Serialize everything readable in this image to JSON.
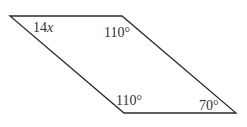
{
  "diagram": {
    "type": "parallelogram",
    "stroke_color": "#2b2b2b",
    "vertices": {
      "top_left": [
        10,
        16
      ],
      "top_right": [
        122,
        16
      ],
      "bottom_right": [
        236,
        113
      ],
      "bottom_left": [
        124,
        113
      ]
    },
    "angles": {
      "top_left": {
        "coef": "14",
        "var": "x"
      },
      "top_right": {
        "text": "110°"
      },
      "bottom_left": {
        "text": "110°"
      },
      "bottom_right": {
        "text": "70°"
      }
    }
  }
}
